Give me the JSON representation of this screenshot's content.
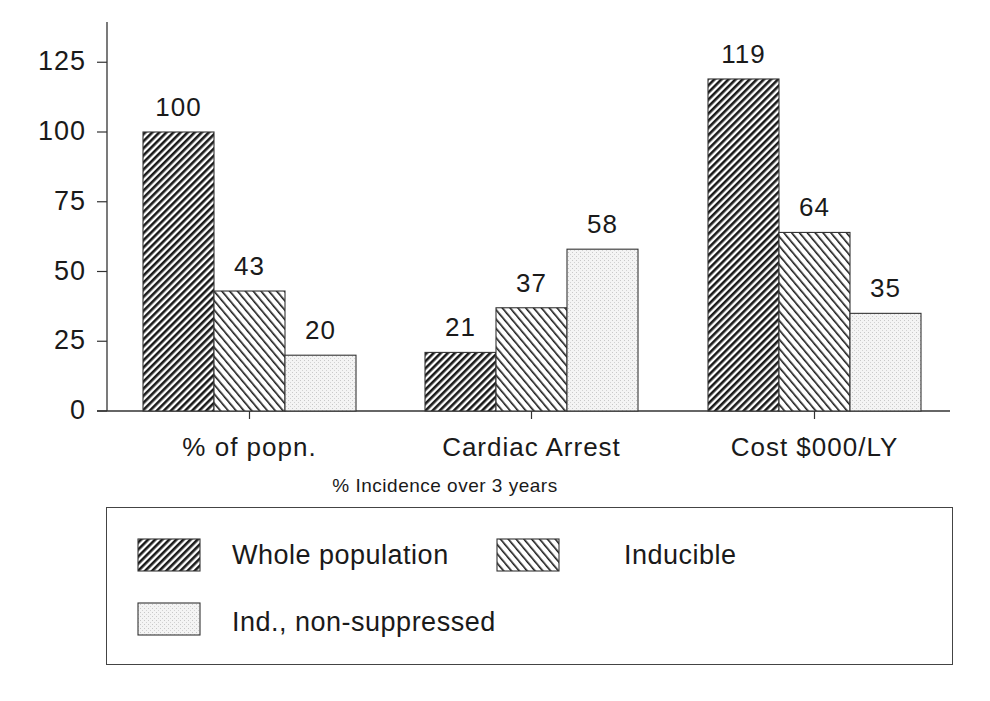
{
  "chart_data": {
    "type": "bar",
    "title": "",
    "subtitle": "% Incidence over 3 years",
    "xlabel": "",
    "ylabel": "",
    "ylim": [
      0,
      137
    ],
    "yticks": [
      0,
      25,
      50,
      75,
      100,
      125
    ],
    "grid": false,
    "legend_position": "bottom",
    "categories": [
      "% of popn.",
      "Cardiac Arrest",
      "Cost $000/LY"
    ],
    "series": [
      {
        "name": "Whole population",
        "pattern": "dense-hatch",
        "values": [
          100,
          21,
          119
        ]
      },
      {
        "name": "Inducible",
        "pattern": "back-hatch",
        "values": [
          43,
          37,
          64
        ]
      },
      {
        "name": "Ind., non-suppressed",
        "pattern": "light-stipple",
        "values": [
          20,
          58,
          35
        ]
      }
    ],
    "data_labels": [
      [
        "100",
        "21",
        "119"
      ],
      [
        "43",
        "37",
        "64"
      ],
      [
        "20",
        "58",
        "35"
      ]
    ]
  },
  "axis": {
    "ytick_labels": [
      "0",
      "25",
      "50",
      "75",
      "100",
      "125"
    ]
  },
  "legend": {
    "items": [
      {
        "label": "Whole population"
      },
      {
        "label": "Inducible"
      },
      {
        "label": "Ind., non-suppressed"
      }
    ]
  },
  "colors": {
    "ink": "#1a1a1a",
    "stipple": "#e4e4e4",
    "background": "#ffffff"
  }
}
